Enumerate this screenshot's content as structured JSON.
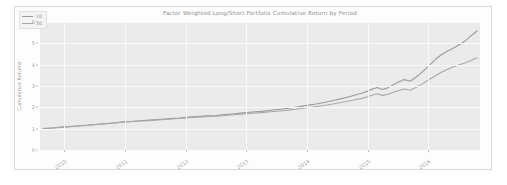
{
  "chart_data": {
    "type": "line",
    "title": "Factor Weighted Long/Short Portfolio Cumulative Return by Period",
    "xlabel": "",
    "ylabel": "Cumulative Returns",
    "xlim": [
      2009.6,
      2016.85
    ],
    "ylim": [
      0,
      6
    ],
    "yticks": [
      0,
      1,
      2,
      3,
      4,
      5,
      6
    ],
    "ytick_labels": [
      "0",
      "1",
      "2",
      "3",
      "4",
      "5",
      "6"
    ],
    "xticks": [
      2010,
      2011,
      2012,
      2013,
      2014,
      2015,
      2016
    ],
    "xtick_labels": [
      "2010",
      "2011",
      "2012",
      "2013",
      "2014",
      "2015",
      "2016"
    ],
    "grid": true,
    "legend_position": "upper left",
    "legend_title": "",
    "x": [
      2009.65,
      2009.8,
      2009.95,
      2010.1,
      2010.25,
      2010.4,
      2010.55,
      2010.7,
      2010.85,
      2011.0,
      2011.15,
      2011.3,
      2011.45,
      2011.6,
      2011.75,
      2011.9,
      2012.05,
      2012.2,
      2012.35,
      2012.5,
      2012.65,
      2012.8,
      2012.95,
      2013.1,
      2013.25,
      2013.4,
      2013.55,
      2013.7,
      2013.85,
      2014.0,
      2014.15,
      2014.3,
      2014.45,
      2014.6,
      2014.75,
      2014.9,
      2015.0,
      2015.08,
      2015.16,
      2015.24,
      2015.32,
      2015.4,
      2015.5,
      2015.6,
      2015.7,
      2015.8,
      2015.9,
      2016.0,
      2016.1,
      2016.2,
      2016.3,
      2016.4,
      2016.5,
      2016.6,
      2016.7,
      2016.8
    ],
    "series": [
      {
        "name": "10",
        "color": "#9a9a9a",
        "values": [
          1.0,
          1.03,
          1.07,
          1.1,
          1.14,
          1.17,
          1.21,
          1.24,
          1.28,
          1.33,
          1.35,
          1.38,
          1.41,
          1.44,
          1.47,
          1.5,
          1.54,
          1.57,
          1.6,
          1.62,
          1.66,
          1.7,
          1.74,
          1.78,
          1.81,
          1.86,
          1.91,
          1.96,
          2.02,
          2.09,
          2.16,
          2.24,
          2.33,
          2.43,
          2.54,
          2.66,
          2.76,
          2.86,
          2.93,
          2.84,
          2.9,
          3.02,
          3.18,
          3.3,
          3.22,
          3.42,
          3.66,
          3.92,
          4.2,
          4.44,
          4.62,
          4.76,
          4.92,
          5.1,
          5.35,
          5.58
        ],
        "start_value": 1.0,
        "end_value": 5.58
      },
      {
        "name": "20",
        "color": "#a8a8a8",
        "values": [
          1.0,
          1.03,
          1.06,
          1.09,
          1.13,
          1.16,
          1.2,
          1.23,
          1.27,
          1.32,
          1.34,
          1.36,
          1.39,
          1.42,
          1.45,
          1.48,
          1.51,
          1.54,
          1.56,
          1.58,
          1.62,
          1.65,
          1.69,
          1.72,
          1.75,
          1.79,
          1.83,
          1.87,
          1.92,
          1.98,
          2.04,
          2.1,
          2.17,
          2.25,
          2.33,
          2.42,
          2.5,
          2.58,
          2.64,
          2.56,
          2.6,
          2.68,
          2.78,
          2.86,
          2.8,
          2.94,
          3.1,
          3.28,
          3.46,
          3.62,
          3.76,
          3.88,
          3.98,
          4.08,
          4.2,
          4.32
        ],
        "start_value": 1.0,
        "end_value": 4.32
      }
    ]
  }
}
